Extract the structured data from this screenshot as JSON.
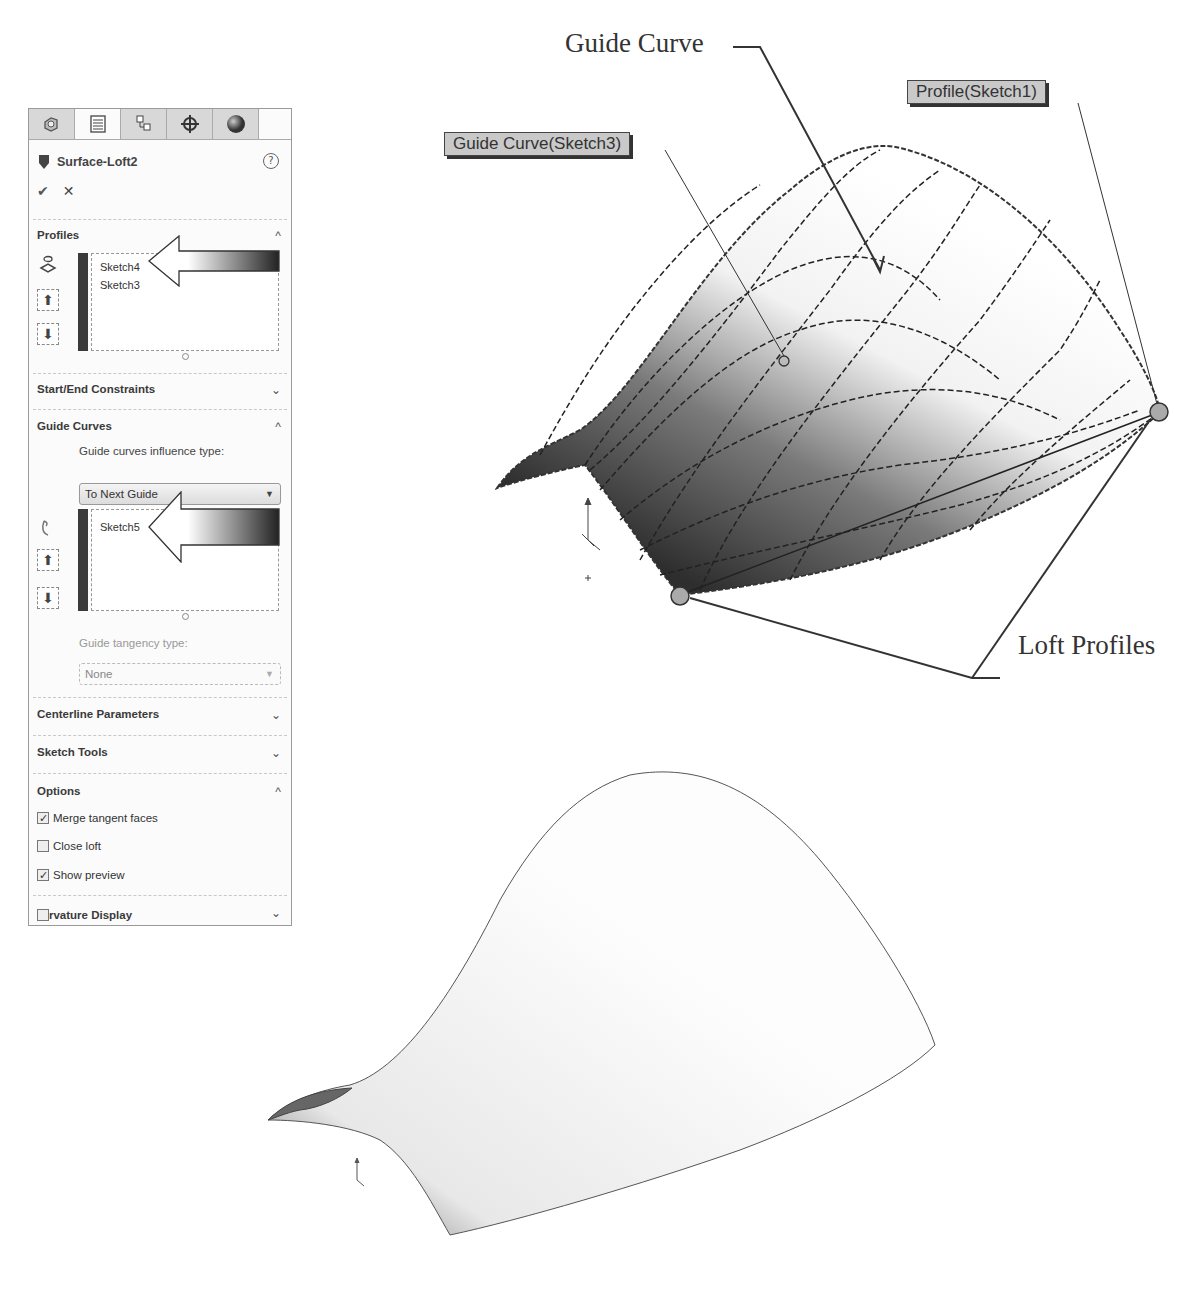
{
  "property_manager": {
    "tabs": [
      {
        "name": "feature-manager",
        "icon": "feature-tree-icon"
      },
      {
        "name": "property-manager",
        "icon": "property-manager-icon",
        "active": true
      },
      {
        "name": "configuration-manager",
        "icon": "configuration-icon"
      },
      {
        "name": "dimxpert-manager",
        "icon": "crosshair-icon"
      },
      {
        "name": "display-manager",
        "icon": "appearance-sphere-icon"
      }
    ],
    "title": "Surface-Loft2",
    "help": "?",
    "ok": "✔",
    "cancel": "✕",
    "sections": {
      "profiles": {
        "label": "Profiles",
        "expanded": true,
        "items": [
          "Sketch4",
          "Sketch3"
        ]
      },
      "start_end": {
        "label": "Start/End Constraints",
        "expanded": false
      },
      "guide_curves": {
        "label": "Guide Curves",
        "expanded": true,
        "influence_label": "Guide curves influence type:",
        "influence_value": "To Next Guide",
        "items": [
          "Sketch5"
        ],
        "tangency_label": "Guide tangency type:",
        "tangency_value": "None"
      },
      "centerline": {
        "label": "Centerline Parameters",
        "expanded": false
      },
      "sketch_tools": {
        "label": "Sketch Tools",
        "expanded": false
      },
      "options": {
        "label": "Options",
        "expanded": true,
        "checkboxes": [
          {
            "label": "Merge tangent faces",
            "checked": true
          },
          {
            "label": "Close loft",
            "checked": false
          },
          {
            "label": "Show preview",
            "checked": true
          }
        ]
      },
      "curvature": {
        "label": "rvature Display",
        "expanded": false
      }
    },
    "chevron_up": "^",
    "chevron_down": "⌄"
  },
  "callouts": {
    "guide_curve_tag": "Guide Curve(Sketch3)",
    "profile_tag": "Profile(Sketch1)",
    "guide_curve_annotation": "Guide Curve",
    "loft_profiles_annotation": "Loft Profiles"
  }
}
